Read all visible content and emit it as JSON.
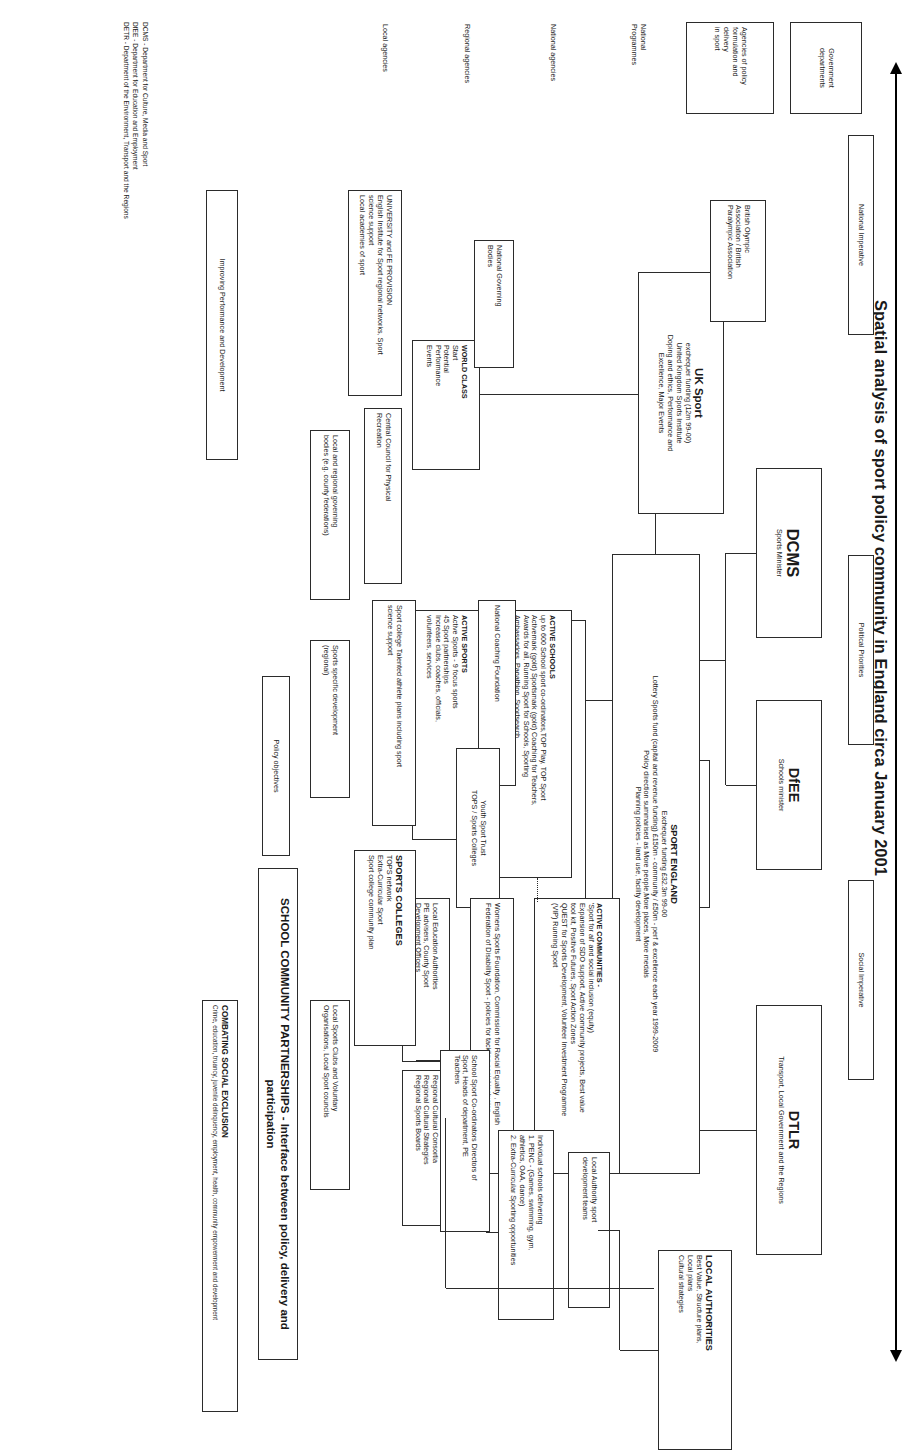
{
  "title": "Spatial analysis of sport policy community in England circa January 2001",
  "axis": {
    "name": "national-to-local-axis"
  },
  "row_labels": [
    {
      "id": "government-departments",
      "text": "Government\ndepartments"
    },
    {
      "id": "agencies-of-policy",
      "text": "Agencies of policy\nformulation and\ndelivery\nin sport"
    },
    {
      "id": "national-programmes",
      "text": "National\nProgrammes"
    },
    {
      "id": "national-agencies",
      "text": "National agencies"
    },
    {
      "id": "regional-agencies",
      "text": "Regional agencies"
    },
    {
      "id": "local-agencies",
      "text": "Local agencies"
    }
  ],
  "drivers": [
    {
      "id": "national-imperative",
      "text": "National Imperative"
    },
    {
      "id": "political-priorities",
      "text": "Political Priorities"
    },
    {
      "id": "social-imperative",
      "text": "Social Imperative"
    }
  ],
  "departments": [
    {
      "id": "dcms",
      "name": "DCMS",
      "sub": "Sports Minister"
    },
    {
      "id": "dfee",
      "name": "DfEE",
      "sub": "Schools minister"
    },
    {
      "id": "dtlr",
      "name": "DTLR",
      "sub": "Transport, Local Government and the Regions"
    }
  ],
  "boxes": {
    "uk_sport": {
      "title": "UK Sport",
      "body": "exchequer  funding (12m 99-00)\nUnited Kingdom Sports Institute\nDoping and ethics, Performance and\nExcellence, Major Events"
    },
    "sport_england": {
      "title": "SPORT ENGLAND",
      "body": "Exchequer funding £32.3m 99-00\nLottery Sports fund (capital and revenue funding)  £150m - community / £50m - perf & excellence each year 1999-2009\nPolicy direction summarised as More people,More places, More medals\nPlanning policies  - land use, facility development"
    },
    "social_exclusion_unit": {
      "text": "Social Exclusion Unit - PAT 10, PAT 11, PAT 12"
    },
    "active_communities": {
      "title": "ACTIVE COMMUNITIES -",
      "body": "'Sport for all' and social inclusion (equity)\nExpansion of SDO support, Active community projects, Best value\ntool kit, Positive Futures, Sport Action Zones\nQUEST for Sports Development, Volunteer Investment Programme\n(VIP) Running Sport"
    },
    "active_schools": {
      "title": "ACTIVE SCHOOLS",
      "body": "up to 600 School sport co-ordinators,TOP Play, TOP Sport\nActivemark (gold) Sportsmark (gold) Coaching for Teachers,\nAwards for all, Running Sport for Schools, Sporting\nAmbassadors, Panathlon, Sportsearch"
    },
    "active_sports": {
      "title": "ACTIVE SPORTS",
      "body": "Active Sports - 9 focus sports\n45 Sport partnerships\nIncrease clubs, coaches, officials,\nvolunteers, services"
    },
    "world_class": {
      "title": "WORLD CLASS",
      "body": "Start\nPotential\nPerformance\nEvents"
    },
    "boa": {
      "text": "British Olympic\nAssociation / British\nParalympic Association"
    },
    "ngb": {
      "text": "National Governing\nBodies"
    },
    "ccpr": {
      "text": "Central Council for Physical\nRecreation"
    },
    "ncf": {
      "text": "National Coaching Foundation"
    },
    "youth_sport_trust": {
      "text": "Youth Sport Trust\nTOPS / Sports Colleges"
    },
    "womens_sports": {
      "text": "Womens Sports Foundation, Commission for Racial Equality , English\nFederation of Disability Sport - policies for tackling social inclusion"
    },
    "local_education": {
      "text": "Local Education Authorities\nPE advisers, County Sport\nDevelopment Officers"
    },
    "regional_cultural": {
      "text": "Regional Cultural Consortia\nRegional Cultural Strategies\nRegional Sports Boards"
    },
    "local_authorities": {
      "title": "LOCAL AUTHORITIES",
      "body": "Best Value, Structure plans,\nLocal plans\nCultural strategies"
    },
    "la_sport_dev": {
      "text": "Local Authority sport\ndevelopment  teams"
    },
    "university_fe": {
      "text": "UNIVERSITY  and FE PROVISION\nEnglish Institute for Sport regional networks, Sport\nscience support\nLocal academies of sport"
    },
    "local_regional_gb": {
      "text": "Local and regional governing\nbodies (e.g. county federations)"
    },
    "sports_specific": {
      "text": "Sports specific development\n(regional)"
    },
    "individual_schools": {
      "text": "Individual schools delivering\n1. PENC - (Games, swimming, gym,\nathletics, OAA, dance)\n2. Extra-Curricular Sporting opportunities"
    },
    "school_sport_coord": {
      "text": "School Sport Co-ordinators Directors of\nSport, Heads of department, PE\nTeachers"
    },
    "sports_colleges": {
      "title": "SPORTS COLLEGES",
      "body": "TOPS network\nExtra-Curricular Sport\nSport college community plan"
    },
    "sport_college_athlete": {
      "text": "Sport college Talented athlete plans including  sport\nscience support"
    },
    "local_sports_clubs": {
      "text": "Local Sports Clubs and Voluntary\nOrganisations, Local Sport councils"
    },
    "policy_objectives": {
      "text": "Policy objectives"
    },
    "school_community_partnerships": {
      "text": "SCHOOL COMMUNITY PARTNERSHIPS - Interface between policy, delivery and participation"
    },
    "combating_social_exclusion": {
      "title": "COMBATING SOCIAL EXCLUSION",
      "body": "Crime, education, truancy, juvenile delinquency, employment, health, community empowerment and development"
    },
    "improving_performance": {
      "text": "Improving Performance and Development"
    }
  },
  "legend": "DCMS - Department for Culture, Media and Sport\nDfEE - Department for Education and Employment\nDETR - Department of the Environment, Transport and the Regions"
}
